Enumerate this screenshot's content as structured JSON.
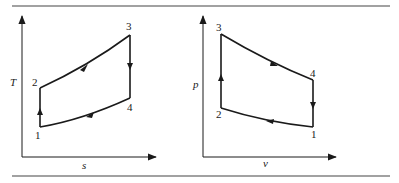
{
  "figure": {
    "rule_color": "#444444",
    "line_color": "#1a1a1a"
  },
  "left_diagram": {
    "type": "T-s diagram",
    "y_axis_label": "T",
    "x_axis_label": "s",
    "points": [
      {
        "label": "1",
        "x": 40,
        "y": 127
      },
      {
        "label": "2",
        "x": 40,
        "y": 88
      },
      {
        "label": "3",
        "x": 130,
        "y": 35
      },
      {
        "label": "4",
        "x": 130,
        "y": 98
      }
    ],
    "processes": [
      {
        "from": "1",
        "to": "2",
        "shape": "vertical line",
        "arrow": "up"
      },
      {
        "from": "2",
        "to": "3",
        "shape": "concave-up curve",
        "arrow": "toward 3"
      },
      {
        "from": "3",
        "to": "4",
        "shape": "vertical line",
        "arrow": "down"
      },
      {
        "from": "4",
        "to": "1",
        "shape": "curve",
        "arrow": "toward 1"
      }
    ]
  },
  "right_diagram": {
    "type": "p-v diagram",
    "y_axis_label": "p",
    "x_axis_label": "v",
    "points": [
      {
        "label": "1",
        "x": 313,
        "y": 127
      },
      {
        "label": "2",
        "x": 221,
        "y": 108
      },
      {
        "label": "3",
        "x": 221,
        "y": 34
      },
      {
        "label": "4",
        "x": 313,
        "y": 80
      }
    ],
    "processes": [
      {
        "from": "1",
        "to": "2",
        "shape": "curve",
        "arrow": "toward 2"
      },
      {
        "from": "2",
        "to": "3",
        "shape": "vertical line",
        "arrow": "up"
      },
      {
        "from": "3",
        "to": "4",
        "shape": "curve",
        "arrow": "toward 4"
      },
      {
        "from": "4",
        "to": "1",
        "shape": "vertical line",
        "arrow": "down"
      }
    ]
  }
}
